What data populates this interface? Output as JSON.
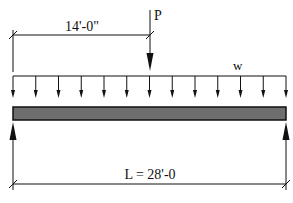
{
  "diagram": {
    "type": "simply-supported-beam-loading",
    "point_load": {
      "label": "P",
      "position_label": "14'-0\""
    },
    "distributed_load": {
      "label": "w",
      "arrow_count": 13
    },
    "span": {
      "label": "L = 28'-0"
    },
    "colors": {
      "beam_fill": "#6e6e6e",
      "beam_border": "#111111",
      "line": "#111111"
    }
  }
}
